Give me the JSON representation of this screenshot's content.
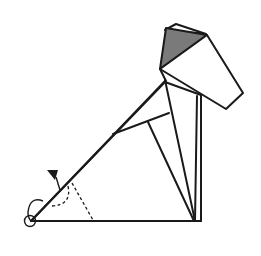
{
  "diagram": {
    "colors": {
      "line": "#1a1a1a",
      "paper": "#ffffff",
      "shaded_face": "#7a7a7a"
    },
    "annotations": {
      "fold_arrow": "arrow indicating fold direction (upward/back)",
      "pivot_marker": "circle marking pivot point at bottom-left corner",
      "valley_fold_line": "dashed fold line"
    }
  }
}
